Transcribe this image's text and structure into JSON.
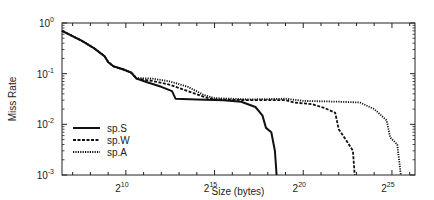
{
  "chart_data": {
    "type": "line",
    "title": "",
    "xlabel": "Size (bytes)",
    "ylabel": "Miss Rate",
    "xscale": "log2",
    "yscale": "log10",
    "xlim_log2": [
      6.4,
      26.3
    ],
    "ylim": [
      0.001,
      1
    ],
    "grid": false,
    "legend_position": "lower left",
    "x_ticks": [
      {
        "exp": 10,
        "label": "2",
        "sup": "10"
      },
      {
        "exp": 15,
        "label": "2",
        "sup": "15"
      },
      {
        "exp": 20,
        "label": "2",
        "sup": "20"
      },
      {
        "exp": 25,
        "label": "2",
        "sup": "25"
      }
    ],
    "y_ticks": [
      {
        "exp": 0,
        "label": "10",
        "sup": "0"
      },
      {
        "exp": -1,
        "label": "10",
        "sup": "-1"
      },
      {
        "exp": -2,
        "label": "10",
        "sup": "-2"
      },
      {
        "exp": -3,
        "label": "10",
        "sup": "-3"
      }
    ],
    "series": [
      {
        "name": "sp.S",
        "style": "solid",
        "points_log2x_y": [
          [
            6.4,
            0.7
          ],
          [
            7.5,
            0.45
          ],
          [
            8.2,
            0.32
          ],
          [
            8.8,
            0.22
          ],
          [
            9.0,
            0.17
          ],
          [
            9.3,
            0.14
          ],
          [
            9.9,
            0.12
          ],
          [
            10.3,
            0.105
          ],
          [
            10.6,
            0.08
          ],
          [
            11.2,
            0.068
          ],
          [
            12.0,
            0.055
          ],
          [
            12.6,
            0.045
          ],
          [
            12.8,
            0.032
          ],
          [
            14.0,
            0.031
          ],
          [
            15.5,
            0.03
          ],
          [
            16.5,
            0.028
          ],
          [
            17.3,
            0.022
          ],
          [
            17.7,
            0.015
          ],
          [
            17.9,
            0.0085
          ],
          [
            18.2,
            0.007
          ],
          [
            18.4,
            0.003
          ],
          [
            18.5,
            0.001
          ]
        ]
      },
      {
        "name": "sp.W",
        "style": "dashed",
        "points_log2x_y": [
          [
            6.4,
            0.7
          ],
          [
            7.5,
            0.45
          ],
          [
            8.2,
            0.32
          ],
          [
            8.8,
            0.22
          ],
          [
            9.0,
            0.17
          ],
          [
            9.3,
            0.14
          ],
          [
            9.9,
            0.12
          ],
          [
            10.3,
            0.105
          ],
          [
            10.6,
            0.08
          ],
          [
            11.5,
            0.072
          ],
          [
            12.5,
            0.06
          ],
          [
            13.5,
            0.045
          ],
          [
            14.5,
            0.034
          ],
          [
            15.0,
            0.031
          ],
          [
            17.0,
            0.03
          ],
          [
            19.0,
            0.03
          ],
          [
            19.5,
            0.027
          ],
          [
            20.5,
            0.025
          ],
          [
            21.2,
            0.021
          ],
          [
            21.8,
            0.017
          ],
          [
            22.0,
            0.008
          ],
          [
            22.4,
            0.005
          ],
          [
            22.8,
            0.003
          ],
          [
            22.9,
            0.001
          ]
        ]
      },
      {
        "name": "sp.A",
        "style": "dotted",
        "points_log2x_y": [
          [
            6.4,
            0.7
          ],
          [
            7.5,
            0.45
          ],
          [
            8.2,
            0.32
          ],
          [
            8.8,
            0.22
          ],
          [
            9.0,
            0.17
          ],
          [
            9.3,
            0.14
          ],
          [
            9.9,
            0.12
          ],
          [
            10.3,
            0.105
          ],
          [
            10.6,
            0.082
          ],
          [
            11.5,
            0.08
          ],
          [
            12.5,
            0.07
          ],
          [
            13.5,
            0.055
          ],
          [
            14.4,
            0.038
          ],
          [
            15.0,
            0.033
          ],
          [
            17.0,
            0.031
          ],
          [
            19.0,
            0.032
          ],
          [
            20.0,
            0.029
          ],
          [
            22.0,
            0.028
          ],
          [
            23.2,
            0.027
          ],
          [
            24.0,
            0.02
          ],
          [
            24.7,
            0.012
          ],
          [
            24.9,
            0.0055
          ],
          [
            25.3,
            0.004
          ],
          [
            25.5,
            0.001
          ]
        ]
      }
    ]
  },
  "legend": [
    {
      "label": "sp.S",
      "style": "solid"
    },
    {
      "label": "sp.W",
      "style": "dashed"
    },
    {
      "label": "sp.A",
      "style": "dotted"
    }
  ],
  "colors": {
    "line": "#111111",
    "axis": "#222222",
    "background": "#ffffff"
  }
}
